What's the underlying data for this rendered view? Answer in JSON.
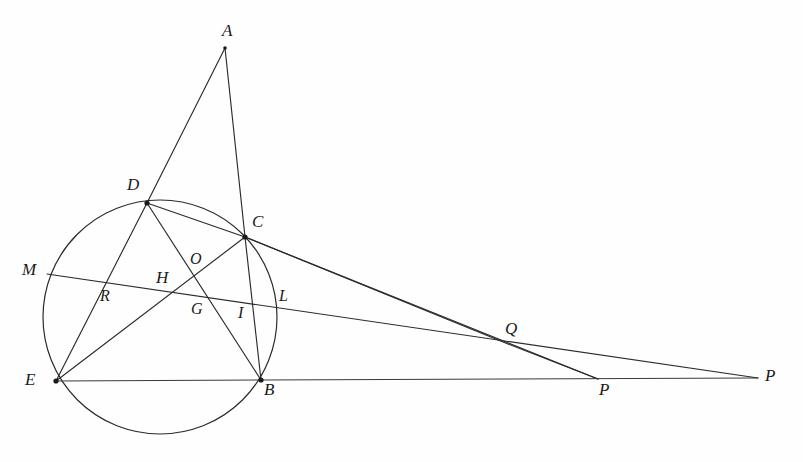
{
  "figure": {
    "type": "euclidean-geometry-diagram",
    "width": 803,
    "height": 462,
    "background_color": "#fefefe",
    "stroke_color": "#2b2b2b"
  },
  "circle": {
    "label": "circumcircle",
    "cx": 160,
    "cy": 317,
    "r": 117
  },
  "points": [
    {
      "id": "A",
      "label": "A",
      "x": 225,
      "y": 48,
      "lx": 222,
      "ly": 22,
      "dot": false
    },
    {
      "id": "D",
      "label": "D",
      "x": 147,
      "y": 203,
      "lx": 129,
      "ly": 178,
      "dot": true
    },
    {
      "id": "C",
      "label": "C",
      "x": 245,
      "y": 237,
      "lx": 252,
      "ly": 215,
      "dot": true
    },
    {
      "id": "M",
      "label": "M",
      "x": 47,
      "y": 274,
      "lx": 23,
      "ly": 262,
      "dot": false
    },
    {
      "id": "O",
      "label": "O",
      "x": 198,
      "y": 274,
      "lx": 190,
      "ly": 250,
      "dot": false
    },
    {
      "id": "R",
      "label": "R",
      "x": 104,
      "y": 285,
      "lx": 101,
      "ly": 287,
      "dot": false
    },
    {
      "id": "H",
      "label": "H",
      "x": 175,
      "y": 288,
      "lx": 158,
      "ly": 269,
      "dot": false
    },
    {
      "id": "G",
      "label": "G",
      "x": 203,
      "y": 298,
      "lx": 192,
      "ly": 300,
      "dot": false
    },
    {
      "id": "L",
      "label": "L",
      "x": 285,
      "y": 300,
      "lx": 280,
      "ly": 287,
      "dot": false
    },
    {
      "id": "I",
      "label": "I",
      "x": 244,
      "y": 313,
      "lx": 238,
      "ly": 305,
      "dot": false
    },
    {
      "id": "E",
      "label": "E",
      "x": 56,
      "y": 381,
      "lx": 28,
      "ly": 372,
      "dot": true
    },
    {
      "id": "B",
      "label": "B",
      "x": 261,
      "y": 380,
      "lx": 264,
      "ly": 380,
      "dot": true
    },
    {
      "id": "Q",
      "label": "Q",
      "x": 508,
      "y": 344,
      "lx": 507,
      "ly": 320,
      "dot": false
    },
    {
      "id": "P1",
      "label": "P",
      "x": 598,
      "y": 379,
      "lx": 600,
      "ly": 380,
      "dot": false
    },
    {
      "id": "P2",
      "label": "P",
      "x": 758,
      "y": 378,
      "lx": 765,
      "ly": 366,
      "dot": false
    }
  ],
  "segments": [
    {
      "name": "A-D-E",
      "from": "A",
      "to": "E",
      "note": "line from A through D down to E"
    },
    {
      "name": "A-C-B",
      "from": "A",
      "to": "B",
      "note": "line from A through C down to B"
    },
    {
      "name": "D-O-G-I-B",
      "from": "D",
      "to": "B",
      "note": "cevian from D through O, G, I to B"
    },
    {
      "name": "D-C-Q",
      "from": "D",
      "to": "Q",
      "note": "line from D through C extended to Q and on to P"
    },
    {
      "name": "E-H-O-C",
      "from": "E",
      "to": "C",
      "note": "line from E through H and O to C"
    },
    {
      "name": "E-B-P",
      "from": "E",
      "to": "P2",
      "note": "baseline from E through B extended to far P"
    },
    {
      "name": "M-R-H-G-L-P",
      "from": "M",
      "to": "P2",
      "note": "transversal from M through R, H, G, L extended to far P"
    },
    {
      "name": "C-I-P",
      "from": "C",
      "to": "P1",
      "note": "line from C through I down to P on the baseline"
    },
    {
      "name": "Q-P",
      "from": "Q",
      "to": "P1",
      "note": "short segment of the D-C line beyond Q down to P"
    }
  ],
  "labels_text": {
    "A": "A",
    "B": "B",
    "C": "C",
    "D": "D",
    "E": "E",
    "G": "G",
    "H": "H",
    "I": "I",
    "L": "L",
    "M": "M",
    "O": "O",
    "P1": "P",
    "P2": "P",
    "Q": "Q",
    "R": "R"
  }
}
